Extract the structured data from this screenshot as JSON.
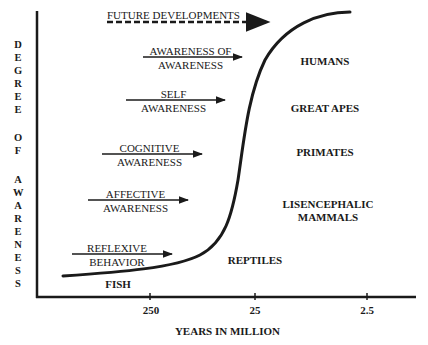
{
  "y_axis": {
    "label": "DEGREE OF AWARENESS",
    "letters": [
      "D",
      "E",
      "G",
      "R",
      "E",
      "E",
      "",
      "O",
      "F",
      "",
      "A",
      "W",
      "A",
      "R",
      "E",
      "N",
      "E",
      "S",
      "S"
    ]
  },
  "x_axis": {
    "label": "YEARS IN MILLION",
    "ticks": [
      "250",
      "25",
      "2.5"
    ]
  },
  "arrows": [
    {
      "id": "future",
      "line1": "FUTURE DEVELOPMENTS",
      "line2": ""
    },
    {
      "id": "aoa",
      "line1": "AWARENESS OF",
      "line2": "AWARENESS"
    },
    {
      "id": "self",
      "line1": "SELF",
      "line2": "AWARENESS"
    },
    {
      "id": "cognitive",
      "line1": "COGNITIVE",
      "line2": "AWARENESS"
    },
    {
      "id": "affective",
      "line1": "AFFECTIVE",
      "line2": "AWARENESS"
    },
    {
      "id": "reflexive",
      "line1": "REFLEXIVE",
      "line2": "BEHAVIOR"
    }
  ],
  "species": {
    "humans": "HUMANS",
    "great_apes": "GREAT APES",
    "primates": "PRIMATES",
    "lisencephalic_1": "LISENCEPHALIC",
    "lisencephalic_2": "MAMMALS",
    "reptiles": "REPTILES",
    "fish": "FISH"
  }
}
